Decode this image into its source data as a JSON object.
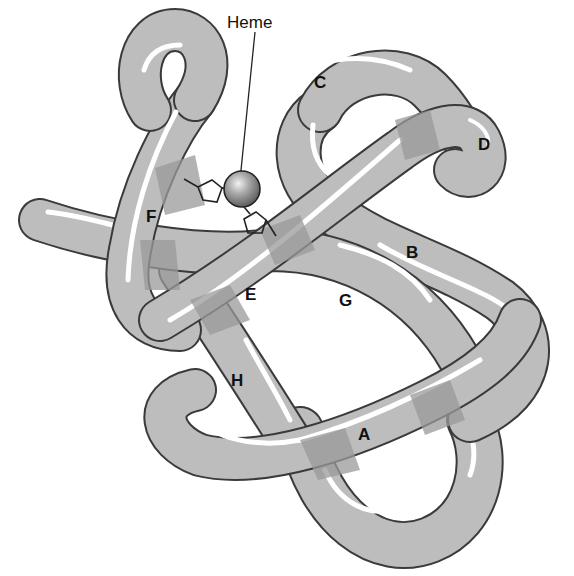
{
  "diagram": {
    "type": "protein tertiary structure (myoglobin) tube diagram",
    "callout": {
      "label": "Heme"
    },
    "helices": [
      {
        "id": "A",
        "label": "A"
      },
      {
        "id": "B",
        "label": "B"
      },
      {
        "id": "C",
        "label": "C"
      },
      {
        "id": "D",
        "label": "D"
      },
      {
        "id": "E",
        "label": "E"
      },
      {
        "id": "F",
        "label": "F"
      },
      {
        "id": "G",
        "label": "G"
      },
      {
        "id": "H",
        "label": "H"
      }
    ],
    "colors": {
      "tube": "#bdbdbd",
      "tube_outline": "#3a3a3a",
      "overlap_shade": "#9a9a9a",
      "highlight": "#ffffff",
      "heme_sphere": "#8a8a8a"
    }
  }
}
